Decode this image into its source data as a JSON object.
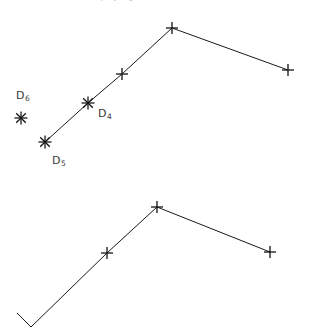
{
  "figure": {
    "background_color": "#ffffff",
    "line_color": "#1a1a1a",
    "marker_color": "#111111",
    "label_color": "#3a3a3a",
    "clipped_caption_text": "distance matrix for phylogenetic tree",
    "width": 311,
    "height": 329
  },
  "labels": [
    {
      "id": "label-d6",
      "base": "D",
      "subscript": "6",
      "x": 16,
      "y": 90
    },
    {
      "id": "label-d4",
      "base": "D",
      "subscript": "4",
      "x": 98,
      "y": 108
    },
    {
      "id": "label-d5",
      "base": "D",
      "subscript": "5",
      "x": 52,
      "y": 155
    }
  ],
  "chart_data": {
    "type": "line",
    "title": "",
    "subtitle": "",
    "xlabel": "",
    "ylabel": "",
    "grid": false,
    "legend": "none",
    "axes_visible": false,
    "xlim": [
      0,
      311
    ],
    "ylim": [
      329,
      0
    ],
    "annotations": [
      {
        "text": "D6",
        "x": 16,
        "y": 90,
        "target": "upper.isolated_point"
      },
      {
        "text": "D4",
        "x": 98,
        "y": 108,
        "target": "upper.p1"
      },
      {
        "text": "D5",
        "x": 52,
        "y": 155,
        "target": "upper.p0"
      }
    ],
    "series": [
      {
        "name": "upper-polyline",
        "marker": "mixed-star-plus",
        "points": [
          {
            "x": 45,
            "y": 142,
            "marker": "star",
            "label": "D5"
          },
          {
            "x": 88,
            "y": 103,
            "marker": "star",
            "label": "D4"
          },
          {
            "x": 122,
            "y": 74,
            "marker": "plus",
            "label": ""
          },
          {
            "x": 172,
            "y": 28,
            "marker": "plus",
            "label": ""
          },
          {
            "x": 288,
            "y": 70,
            "marker": "plus",
            "label": ""
          }
        ]
      },
      {
        "name": "upper-isolated-point",
        "marker": "star",
        "points": [
          {
            "x": 21,
            "y": 118,
            "marker": "star",
            "label": "D6"
          }
        ]
      },
      {
        "name": "lower-polyline",
        "marker": "plus",
        "points": [
          {
            "x": 17,
            "y": 313,
            "marker": "none",
            "label": ""
          },
          {
            "x": 31,
            "y": 327,
            "marker": "none",
            "label": ""
          },
          {
            "x": 107,
            "y": 253,
            "marker": "plus",
            "label": ""
          },
          {
            "x": 157,
            "y": 207,
            "marker": "plus",
            "label": ""
          },
          {
            "x": 270,
            "y": 252,
            "marker": "plus",
            "label": ""
          }
        ]
      }
    ]
  }
}
